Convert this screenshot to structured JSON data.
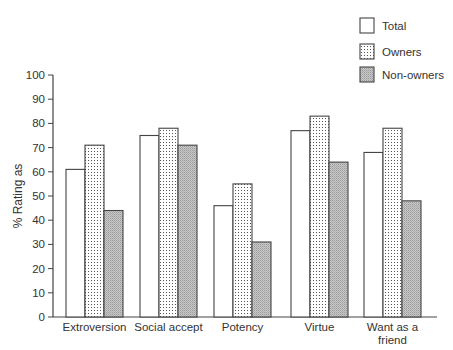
{
  "chart_data": {
    "type": "bar",
    "title": "",
    "xlabel": "",
    "ylabel": "% Rating as",
    "ylim": [
      0,
      100
    ],
    "yticks": [
      0,
      10,
      20,
      30,
      40,
      50,
      60,
      70,
      80,
      90,
      100
    ],
    "grid": false,
    "legend_position": "top-right",
    "categories": [
      "Extroversion",
      "Social accept",
      "Potency",
      "Virtue",
      "Want as a friend"
    ],
    "category_labels": [
      [
        "Extroversion"
      ],
      [
        "Social accept"
      ],
      [
        "Potency"
      ],
      [
        "Virtue"
      ],
      [
        "Want as a",
        "friend"
      ]
    ],
    "series": [
      {
        "name": "Total",
        "pattern": "white",
        "values": [
          61,
          75,
          46,
          77,
          68
        ]
      },
      {
        "name": "Owners",
        "pattern": "dotted",
        "values": [
          71,
          78,
          55,
          83,
          78
        ]
      },
      {
        "name": "Non-owners",
        "pattern": "grey-hatched",
        "values": [
          44,
          71,
          31,
          64,
          48
        ]
      }
    ]
  }
}
